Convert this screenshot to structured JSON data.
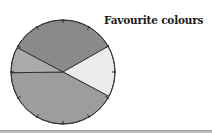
{
  "chart_data": {
    "type": "pie",
    "title": "Favourite colours",
    "labels_visible": false,
    "legend": "none",
    "slices": [
      {
        "name": "slice-top",
        "percent": 34,
        "color": "#8a8a8a"
      },
      {
        "name": "slice-right",
        "percent": 16,
        "color": "#ececec"
      },
      {
        "name": "slice-bottom",
        "percent": 42,
        "color": "#9d9d9d"
      },
      {
        "name": "slice-left",
        "percent": 8,
        "color": "#ababab"
      }
    ],
    "start_angle_deg": 208,
    "direction": "clockwise",
    "rim_ticks": 12
  },
  "title": "Favourite colours"
}
